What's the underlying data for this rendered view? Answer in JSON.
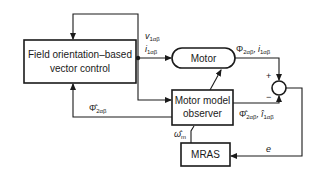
{
  "diagram": {
    "blocks": {
      "field_orientation": {
        "line1": "Field orientation–based",
        "line2": "vector control"
      },
      "motor": {
        "label": "Motor"
      },
      "observer": {
        "line1": "Motor model",
        "line2": "observer"
      },
      "mras": {
        "label": "MRAS"
      }
    },
    "signals": {
      "voltage": {
        "main": "v",
        "sub": "1αβ"
      },
      "current": {
        "main": "i",
        "sub": "1αβ"
      },
      "motor_out_flux": {
        "main": "Φ",
        "sub": "2αβ"
      },
      "motor_out_sep": ",",
      "motor_out_current": {
        "main": "i",
        "sub": "1αβ"
      },
      "est_flux_feedback": {
        "main": "Φ̂",
        "sub": "2αβ"
      },
      "obs_out_flux": {
        "main": "Φ̂",
        "sub": "2αβ"
      },
      "obs_out_sep": ",",
      "obs_out_current": {
        "main": "î",
        "sub": "1αβ"
      },
      "speed_est": {
        "main": "ω̂",
        "sub": "m"
      },
      "error": {
        "main": "e"
      }
    },
    "summer": {
      "plus": "+",
      "minus": "−"
    }
  }
}
